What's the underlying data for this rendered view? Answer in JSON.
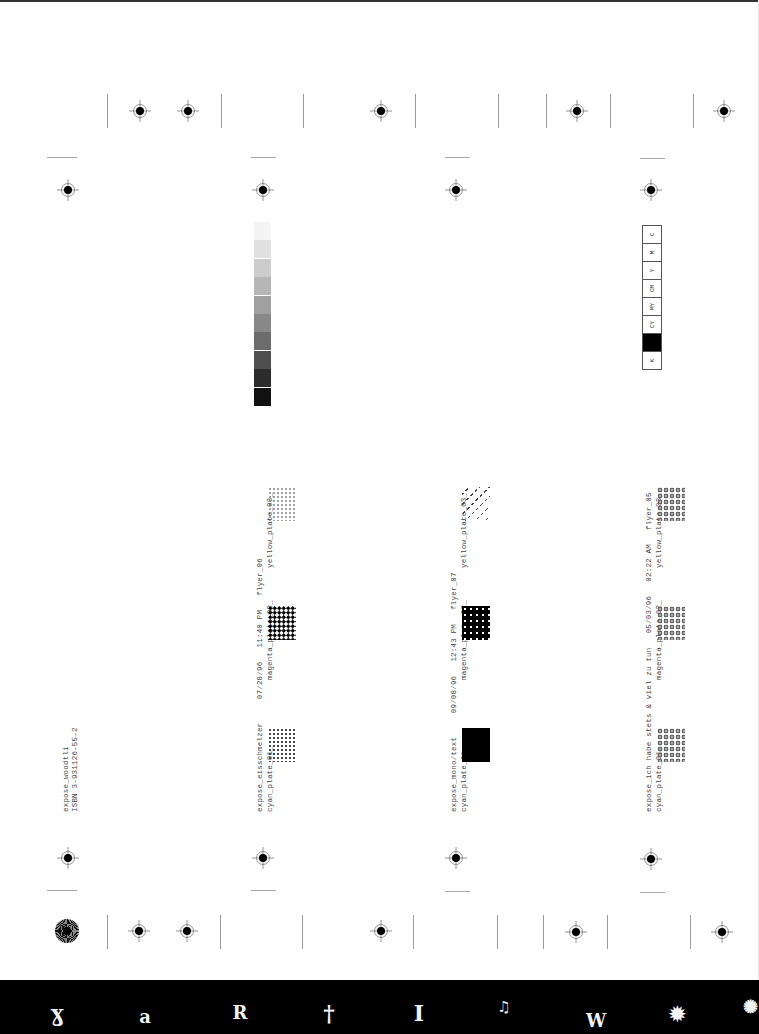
{
  "sheet": {
    "orientation": "rotated-90",
    "header": {
      "title": "expose_woodtli",
      "isbn": "ISBN 3-931126-55-2"
    },
    "gray_ramp": {
      "steps": [
        "#f4f4f4",
        "#e0e0e0",
        "#cccccc",
        "#b6b6b6",
        "#a0a0a0",
        "#888888",
        "#6c6c6c",
        "#4f4f4f",
        "#2c2c2c",
        "#111111"
      ]
    },
    "cmyk_bar": {
      "cells": [
        {
          "label": "C",
          "fill": "#ffffff"
        },
        {
          "label": "M",
          "fill": "#ffffff"
        },
        {
          "label": "Y",
          "fill": "#ffffff"
        },
        {
          "label": "CM",
          "fill": "#ffffff"
        },
        {
          "label": "MY",
          "fill": "#ffffff"
        },
        {
          "label": "CY",
          "fill": "#ffffff"
        },
        {
          "label": "",
          "fill": "#000000"
        },
        {
          "label": "K",
          "fill": "#ffffff"
        }
      ]
    },
    "flyers": [
      {
        "line1": "expose_eisschmelzer     07/28/96   11:40 PM   flyer_06",
        "plates": [
          "cyan_plate_01_",
          "magenta_plate_02_",
          "yellow_plate_03_"
        ]
      },
      {
        "line1": "expose_mono/text     09/08/96   12:43 PM   flyer_07",
        "plates": [
          "cyan_plate_01_",
          "magenta_plate_02_",
          "yellow_plate_03_"
        ]
      },
      {
        "line1": "expose_ich habe stets & viel zu tun   05/03/96   02:22 AM   flyer_05",
        "plates": [
          "cyan_plate_01_",
          "magenta_plate_02_",
          "yellow_plate_03_"
        ]
      }
    ]
  },
  "footer_bar": {
    "background": "#000000",
    "glyphs": [
      "ɣ",
      "a",
      "R",
      "†",
      "I",
      "♫",
      "W",
      "✹",
      "✺"
    ]
  }
}
